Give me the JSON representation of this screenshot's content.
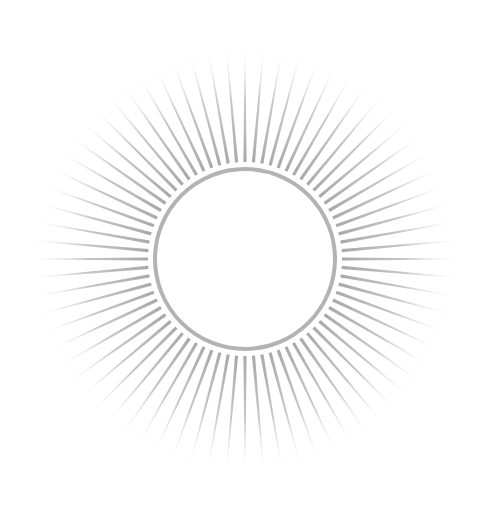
{
  "image": {
    "description": "sunburst",
    "background": "#ffffff",
    "center": {
      "x": 245,
      "y": 259
    },
    "ring": {
      "radius": 90,
      "stroke_width": 4,
      "color": "#b3b3b3"
    },
    "rays": {
      "count": 72,
      "inner_radius": 97,
      "outer_radius": 212,
      "color": "#a8a8a8",
      "inner_width": 3.2,
      "outer_width": 0.8
    }
  }
}
